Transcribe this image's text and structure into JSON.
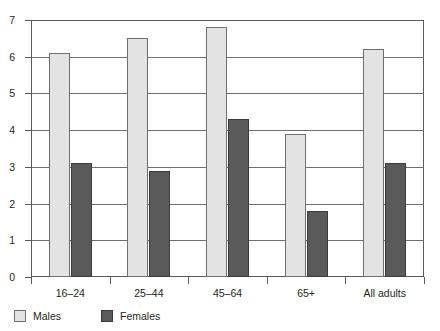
{
  "chart_data": {
    "type": "bar",
    "title": "",
    "subtitle": "",
    "xlabel": "",
    "ylabel": "",
    "categories": [
      "16–24",
      "25–44",
      "45–64",
      "65+",
      "All adults"
    ],
    "series": [
      {
        "name": "Males",
        "color": "#e3e3e3",
        "values": [
          6.1,
          6.5,
          6.8,
          3.9,
          6.2
        ]
      },
      {
        "name": "Females",
        "color": "#5a5a5a",
        "values": [
          3.1,
          2.9,
          4.3,
          1.8,
          3.1
        ]
      }
    ],
    "ylim": [
      0,
      7
    ],
    "y_ticks": [
      0,
      1,
      2,
      3,
      4,
      5,
      6,
      7
    ],
    "y_tick_labels": [
      "0",
      "1",
      "2",
      "3",
      "4",
      "5",
      "6",
      "7"
    ],
    "grid": true,
    "grid_axis": "y",
    "legend_position": "bottom-left",
    "legend": [
      "Males",
      "Females"
    ]
  },
  "legend": {
    "items": [
      {
        "label": "Males",
        "swatch": "male-swatch"
      },
      {
        "label": "Females",
        "swatch": "female-swatch"
      }
    ]
  }
}
